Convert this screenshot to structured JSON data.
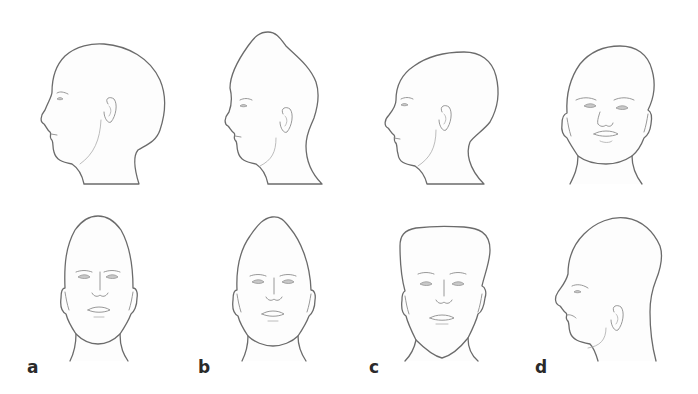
{
  "figure": {
    "type": "anatomical-illustration",
    "line_color": "#6b6b6b",
    "label_color": "#2a2a2a",
    "background": "#ffffff"
  },
  "panels": [
    {
      "label": "a",
      "views": [
        "left-profile (top row)",
        "frontal (bottom row)"
      ],
      "shape": "elongated posteriorly, tall ovoid vault"
    },
    {
      "label": "b",
      "views": [
        "left-profile (top row)",
        "frontal (bottom row)"
      ],
      "shape": "pointed, peaked vertex"
    },
    {
      "label": "c",
      "views": [
        "left-profile (top row)",
        "frontal (bottom row)"
      ],
      "shape": "broad, flat-topped wide vault with triangular face"
    },
    {
      "label": "d",
      "views": [
        "frontal (top row)",
        "left-profile (bottom row)"
      ],
      "shape": "asymmetric skewed vault"
    }
  ]
}
